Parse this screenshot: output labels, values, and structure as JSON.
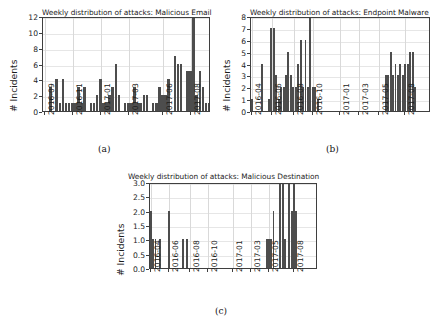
{
  "figure": {
    "background_color": "#ffffff",
    "bar_color": "#4d4d4d",
    "axis_color": "#3f3f3f",
    "grid_color": "#d9d9d9"
  },
  "panels": [
    {
      "caption": "(a)",
      "chart_data": {
        "type": "bar",
        "title": "Weekly distribution of attacks: Malicious Email",
        "xlabel": "",
        "ylabel": "# Incidents",
        "ylim": [
          0,
          12
        ],
        "yticks": [
          0,
          2,
          4,
          6,
          8,
          10,
          12
        ],
        "ytick_labels": [
          "0",
          "2",
          "4",
          "6",
          "8",
          "10",
          "12"
        ],
        "xtick_labels": [
          "2016-09",
          "2016-11",
          "2017-01",
          "2017-03",
          "2017-06",
          "2017-08"
        ],
        "xtick_positions": [
          0,
          9,
          18,
          27,
          38,
          47
        ],
        "grid": true,
        "legend": "none",
        "n_slots": 54,
        "values": [
          0,
          0,
          3,
          0,
          4,
          1,
          4,
          1,
          1,
          1,
          1,
          3,
          1,
          3,
          0,
          1,
          1,
          2,
          4,
          1,
          1,
          2,
          3,
          6,
          2,
          0,
          1,
          1,
          1,
          3,
          1,
          1,
          2,
          2,
          0,
          1,
          1,
          3,
          2,
          2,
          4,
          0,
          7,
          6,
          6,
          0,
          5,
          5,
          12,
          2,
          5,
          3,
          1,
          1
        ]
      }
    },
    {
      "caption": "(b)",
      "chart_data": {
        "type": "bar",
        "title": "Weekly distribution of attacks: Endpoint Malware",
        "xlabel": "",
        "ylabel": "# Incidents",
        "ylim": [
          0,
          8
        ],
        "yticks": [
          0,
          1,
          2,
          3,
          4,
          5,
          6,
          7,
          8
        ],
        "ytick_labels": [
          "0",
          "1",
          "2",
          "3",
          "4",
          "5",
          "6",
          "7",
          "8"
        ],
        "xtick_labels": [
          "2016-04",
          "2016-06",
          "2016-08",
          "2016-10",
          "2017-01",
          "2017-03",
          "2017-05",
          "2017-08"
        ],
        "xtick_positions": [
          0,
          8,
          17,
          25,
          36,
          44,
          52,
          63
        ],
        "grid": true,
        "legend": "none",
        "n_slots": 74,
        "values": [
          1,
          0,
          0,
          0,
          4,
          0,
          0,
          1,
          7,
          7,
          3,
          1,
          2,
          2,
          3,
          5,
          3,
          2,
          2,
          4,
          6,
          2,
          6,
          2,
          8,
          2,
          2,
          1,
          0,
          0,
          0,
          0,
          0,
          0,
          0,
          0,
          0,
          0,
          0,
          0,
          0,
          0,
          0,
          0,
          0,
          0,
          0,
          0,
          0,
          0,
          0,
          0,
          0,
          0,
          0,
          3,
          3,
          5,
          3,
          4,
          3,
          4,
          3,
          4,
          4,
          5,
          5,
          2,
          0,
          0,
          0,
          0,
          0,
          0
        ]
      }
    },
    {
      "caption": "(c)",
      "chart_data": {
        "type": "bar",
        "title": "Weekly distribution of attacks: Malicious Destination",
        "xlabel": "",
        "ylabel": "# Incidents",
        "ylim": [
          0,
          3.0
        ],
        "yticks": [
          0.0,
          0.5,
          1.0,
          1.5,
          2.0,
          2.5,
          3.0
        ],
        "ytick_labels": [
          "0.0",
          "0.5",
          "1.0",
          "1.5",
          "2.0",
          "2.5",
          "3.0"
        ],
        "xtick_labels": [
          "2016-04",
          "2016-06",
          "2016-08",
          "2016-10",
          "2017-01",
          "2017-03",
          "2017-05",
          "2017-08"
        ],
        "xtick_positions": [
          0,
          8,
          17,
          25,
          36,
          44,
          52,
          63
        ],
        "grid": true,
        "legend": "none",
        "n_slots": 74,
        "values": [
          2,
          1,
          1,
          0,
          1,
          0,
          0,
          0,
          2,
          0,
          0,
          0,
          0,
          0,
          1,
          0,
          1,
          0,
          0,
          0,
          0,
          0,
          0,
          0,
          0,
          0,
          0,
          0,
          0,
          0,
          0,
          0,
          0,
          0,
          0,
          0,
          0,
          0,
          0,
          0,
          0,
          0,
          0,
          0,
          0,
          0,
          0,
          0,
          0,
          0,
          0,
          1,
          1,
          1,
          2,
          0,
          0,
          3,
          3,
          1,
          0,
          3,
          2,
          3,
          2,
          0,
          0,
          0,
          0,
          0,
          0,
          0,
          0,
          0
        ]
      }
    }
  ]
}
